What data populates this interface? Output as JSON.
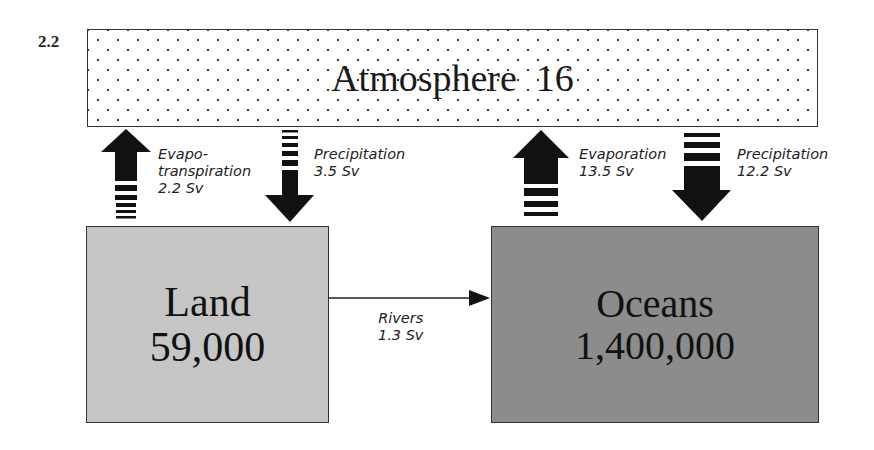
{
  "figure": {
    "label": "2.2"
  },
  "reservoirs": {
    "atmosphere": {
      "name": "Atmosphere",
      "value": "16"
    },
    "land": {
      "name": "Land",
      "value": "59,000",
      "color": "#c6c6c6"
    },
    "oceans": {
      "name": "Oceans",
      "value": "1,400,000",
      "color": "#8c8c8c"
    }
  },
  "fluxes": {
    "evapotranspiration": {
      "line1": "Evapo-",
      "line2": "transpiration",
      "value": "2.2 Sv",
      "direction": "up"
    },
    "land_precipitation": {
      "line1": "Precipitation",
      "value": "3.5 Sv",
      "direction": "down"
    },
    "evaporation": {
      "line1": "Evaporation",
      "value": "13.5 Sv",
      "direction": "up"
    },
    "ocean_precipitation": {
      "line1": "Precipitation",
      "value": "12.2 Sv",
      "direction": "down"
    },
    "rivers": {
      "line1": "Rivers",
      "value": "1.3 Sv",
      "direction": "right"
    }
  }
}
